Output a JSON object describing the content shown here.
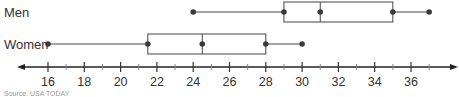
{
  "chart_data": {
    "type": "boxplot",
    "title": "",
    "xlabel": "",
    "ylabel": "",
    "xlim": [
      15,
      38.5
    ],
    "ticks_major": [
      16,
      18,
      20,
      22,
      24,
      26,
      28,
      30,
      32,
      34,
      36
    ],
    "ticks_minor": [
      17,
      19,
      21,
      23,
      25,
      27,
      29,
      31,
      33,
      35,
      37
    ],
    "tick_labels": [
      "16",
      "18",
      "20",
      "22",
      "24",
      "26",
      "28",
      "30",
      "32",
      "34",
      "36"
    ],
    "grid": false,
    "axis_style": "number-line with arrows on both ends",
    "series": [
      {
        "name": "Men",
        "min": 24,
        "q1": 29,
        "median": 31,
        "q3": 35,
        "max": 37
      },
      {
        "name": "Women",
        "min": 16,
        "q1": 21.5,
        "median": 24.5,
        "q3": 28,
        "max": 30
      }
    ],
    "footnote": "Source: USA TODAY"
  },
  "colors": {
    "line": "#444444",
    "point": "#3a3a3a",
    "text": "#333333"
  }
}
